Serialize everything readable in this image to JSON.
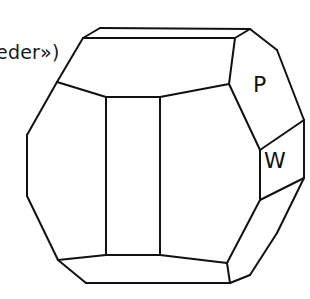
{
  "caption": {
    "text": "eder»)"
  },
  "faces": [
    {
      "id": "P",
      "label": "P"
    },
    {
      "id": "W",
      "label": "W"
    }
  ],
  "style": {
    "stroke_color": "#111111",
    "background": "#ffffff"
  },
  "crystal": {
    "edges": [
      [
        [
          100,
          28
        ],
        [
          250,
          29
        ]
      ],
      [
        [
          83,
          38
        ],
        [
          235,
          38
        ]
      ],
      [
        [
          83,
          38
        ],
        [
          100,
          28
        ]
      ],
      [
        [
          235,
          38
        ],
        [
          250,
          29
        ]
      ],
      [
        [
          83,
          38
        ],
        [
          57,
          82
        ]
      ],
      [
        [
          57,
          82
        ],
        [
          27,
          135
        ]
      ],
      [
        [
          27,
          135
        ],
        [
          27,
          196
        ]
      ],
      [
        [
          27,
          196
        ],
        [
          58,
          260
        ]
      ],
      [
        [
          57,
          82
        ],
        [
          106,
          97
        ]
      ],
      [
        [
          106,
          97
        ],
        [
          160,
          97
        ]
      ],
      [
        [
          160,
          97
        ],
        [
          229,
          84
        ]
      ],
      [
        [
          229,
          84
        ],
        [
          235,
          38
        ]
      ],
      [
        [
          106,
          97
        ],
        [
          106,
          255
        ]
      ],
      [
        [
          160,
          97
        ],
        [
          160,
          255
        ]
      ],
      [
        [
          58,
          260
        ],
        [
          106,
          255
        ]
      ],
      [
        [
          106,
          255
        ],
        [
          160,
          255
        ]
      ],
      [
        [
          160,
          255
        ],
        [
          227,
          263
        ]
      ],
      [
        [
          58,
          260
        ],
        [
          86,
          283
        ]
      ],
      [
        [
          86,
          283
        ],
        [
          230,
          283
        ]
      ],
      [
        [
          227,
          263
        ],
        [
          230,
          283
        ]
      ],
      [
        [
          229,
          84
        ],
        [
          260,
          150
        ]
      ],
      [
        [
          260,
          150
        ],
        [
          260,
          200
        ]
      ],
      [
        [
          260,
          200
        ],
        [
          227,
          263
        ]
      ],
      [
        [
          260,
          150
        ],
        [
          304,
          120
        ]
      ],
      [
        [
          260,
          200
        ],
        [
          304,
          178
        ]
      ],
      [
        [
          250,
          29
        ],
        [
          277,
          50
        ]
      ],
      [
        [
          277,
          50
        ],
        [
          304,
          120
        ]
      ],
      [
        [
          304,
          120
        ],
        [
          304,
          178
        ]
      ],
      [
        [
          304,
          178
        ],
        [
          277,
          233
        ]
      ],
      [
        [
          277,
          233
        ],
        [
          250,
          275
        ]
      ],
      [
        [
          250,
          275
        ],
        [
          230,
          283
        ]
      ]
    ]
  }
}
